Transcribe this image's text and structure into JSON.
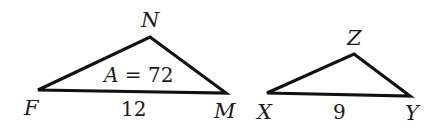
{
  "figure": {
    "stroke_color": "#111111",
    "triangles": [
      {
        "name": "FNM",
        "vertices": {
          "F": {
            "label": "F",
            "x": 38,
            "y": 90
          },
          "N": {
            "label": "N",
            "x": 150,
            "y": 37
          },
          "M": {
            "label": "M",
            "x": 226,
            "y": 93
          }
        },
        "base_label": "12",
        "area_var": "A",
        "area_eq": " = 72"
      },
      {
        "name": "XZY",
        "vertices": {
          "X": {
            "label": "X",
            "x": 267,
            "y": 93
          },
          "Z": {
            "label": "Z",
            "x": 354,
            "y": 54
          },
          "Y": {
            "label": "Y",
            "x": 410,
            "y": 96
          }
        },
        "base_label": "9"
      }
    ]
  }
}
